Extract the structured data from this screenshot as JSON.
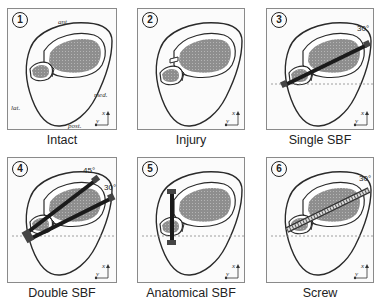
{
  "figure": {
    "panels": [
      {
        "number": "1",
        "caption": "Intact",
        "annotations": {
          "ant": "ant.",
          "med": "med.",
          "lat": "lat.",
          "post": "post."
        }
      },
      {
        "number": "2",
        "caption": "Injury"
      },
      {
        "number": "3",
        "caption": "Single SBF",
        "angle": "30°"
      },
      {
        "number": "4",
        "caption": "Double SBF",
        "angles": [
          "45°",
          "30°"
        ]
      },
      {
        "number": "5",
        "caption": "Anatomical SBF"
      },
      {
        "number": "6",
        "caption": "Screw",
        "angle": "30°"
      }
    ],
    "axes": {
      "x": "x",
      "y": "y"
    },
    "colors": {
      "bone_fill": "#8c8c8c",
      "outline": "#2a2a2a",
      "implant": "#1a1a1a",
      "dashed_line": "#888888"
    }
  }
}
